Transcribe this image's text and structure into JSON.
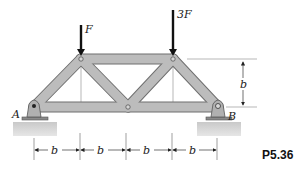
{
  "figure": {
    "problem_number": "P5.36",
    "loads": [
      {
        "label": "F",
        "direction": "down"
      },
      {
        "label": "3F",
        "direction": "down"
      }
    ],
    "supports": [
      {
        "label": "A"
      },
      {
        "label": "B"
      }
    ],
    "dimensions": {
      "height_label": "b",
      "spans": [
        "b",
        "b",
        "b",
        "b"
      ]
    },
    "colors": {
      "member": "#b8b8b8",
      "member_edge": "#6e6e6e",
      "ground": "#cfcfcf",
      "arrow": "#111111"
    }
  }
}
